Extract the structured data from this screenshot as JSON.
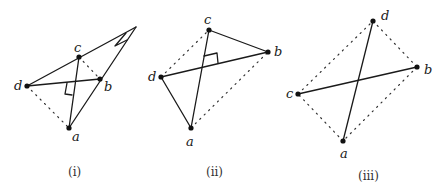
{
  "figures": [
    {
      "caption": "(i)",
      "points": {
        "a": "a",
        "b": "b",
        "c": "c",
        "d": "d"
      }
    },
    {
      "caption": "(ii)",
      "points": {
        "a": "a",
        "b": "b",
        "c": "c",
        "d": "d"
      }
    },
    {
      "caption": "(iii)",
      "points": {
        "a": "a",
        "b": "b",
        "c": "c",
        "d": "d"
      }
    }
  ]
}
